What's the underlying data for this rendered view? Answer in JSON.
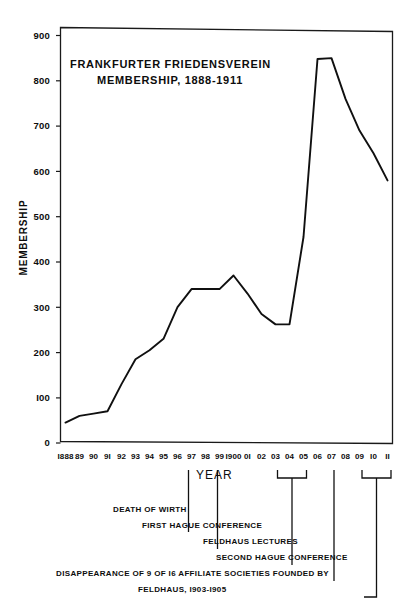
{
  "chart_data": {
    "type": "line",
    "title": "FRANKFURTER  FRIEDENSVEREIN",
    "subtitle": "MEMBERSHIP, 1888-1911",
    "xlabel": "YEAR",
    "ylabel": "MEMBERSHIP",
    "ylim": [
      0,
      900
    ],
    "yticks": [
      0,
      100,
      200,
      300,
      400,
      500,
      600,
      700,
      800,
      900
    ],
    "ytick_labels": [
      "0",
      "I00",
      "200",
      "300",
      "400",
      "500",
      "600",
      "700",
      "800",
      "900"
    ],
    "grid": false,
    "legend": "none",
    "categories": [
      "1888",
      "89",
      "90",
      "91",
      "92",
      "93",
      "94",
      "95",
      "96",
      "97",
      "98",
      "99",
      "1900",
      "01",
      "02",
      "03",
      "04",
      "05",
      "06",
      "07",
      "08",
      "09",
      "10",
      "11"
    ],
    "xtick_labels": [
      "I888",
      "89",
      "90",
      "9I",
      "92",
      "93",
      "94",
      "95",
      "96",
      "97",
      "98",
      "99",
      "I900",
      "0I",
      "02",
      "03",
      "04",
      "05",
      "06",
      "07",
      "08",
      "09",
      "I0",
      "II"
    ],
    "values": [
      45,
      60,
      65,
      70,
      130,
      185,
      205,
      230,
      300,
      340,
      340,
      340,
      370,
      330,
      285,
      262,
      262,
      455,
      848,
      850,
      760,
      690,
      640,
      580
    ],
    "annotations": [
      {
        "label": "DEATH OF WIRTH",
        "year": "97",
        "type": "pointer"
      },
      {
        "label": "FIRST HAGUE CONFERENCE",
        "year": "99",
        "type": "pointer"
      },
      {
        "label": "FELDHAUS LECTURES",
        "year": "03-05",
        "type": "bracket"
      },
      {
        "label": "SECOND HAGUE CONFERENCE",
        "year": "07",
        "type": "pointer"
      },
      {
        "label": "DISAPPEARANCE OF  9  OF  I6  AFFILIATE  SOCIETIES  FOUNDED BY",
        "year": "09-11",
        "type": "bracket"
      },
      {
        "label": "FELDHAUS, I903-I905",
        "year": "",
        "type": "continuation"
      }
    ]
  },
  "figure": {
    "frame_color": "#1a1a1a",
    "line_color": "#101010",
    "background": "#ffffff"
  }
}
